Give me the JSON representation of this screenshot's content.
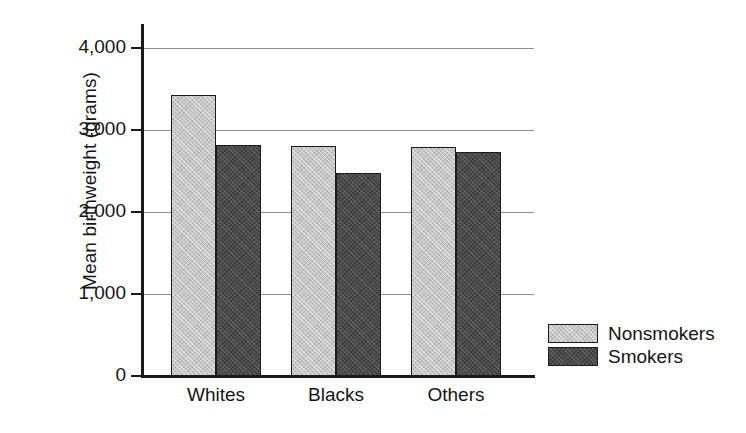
{
  "chart_data": {
    "type": "bar",
    "title": "",
    "xlabel": "",
    "ylabel": "Mean birthweight (grams)",
    "categories": [
      "Whites",
      "Blacks",
      "Others"
    ],
    "series": [
      {
        "name": "Nonsmokers",
        "color": "#c6c6c6",
        "values": [
          3430,
          2810,
          2795
        ]
      },
      {
        "name": "Smokers",
        "color": "#4b4b4b",
        "values": [
          2820,
          2470,
          2735
        ]
      }
    ],
    "ylim": [
      0,
      4000
    ],
    "yticks": [
      0,
      1000,
      2000,
      3000,
      4000
    ],
    "ytick_labels": [
      "0",
      "1,000",
      "2,000",
      "3,000",
      "4,000"
    ],
    "grid": "horizontal",
    "legend_position": "right-bottom"
  },
  "axis": {
    "y_title": "Mean birthweight (grams)"
  },
  "legend": {
    "items": [
      {
        "label": "Nonsmokers"
      },
      {
        "label": "Smokers"
      }
    ]
  }
}
